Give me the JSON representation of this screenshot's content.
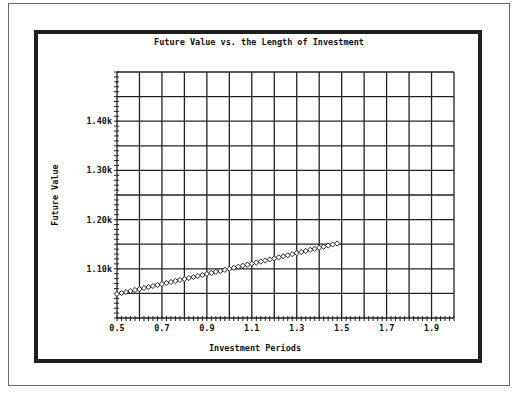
{
  "chart_data": {
    "type": "scatter",
    "title": "Future Value vs. the Length of Investment",
    "xlabel": "Investment Periods",
    "ylabel": "Future Value",
    "xlim": [
      0.5,
      2.0
    ],
    "ylim": [
      1000,
      1500
    ],
    "xticks": [
      0.5,
      0.7,
      0.9,
      1.1,
      1.3,
      1.5,
      1.7,
      1.9
    ],
    "xtick_labels": [
      "0.5",
      "0.7",
      "0.9",
      "1.1",
      "1.3",
      "1.5",
      "1.7",
      "1.9"
    ],
    "yticks": [
      1100,
      1200,
      1300,
      1400
    ],
    "ytick_labels": [
      "1.10k",
      "1.20k",
      "1.30k",
      "1.40k"
    ],
    "x_gridlines_step": 0.1,
    "y_gridlines_step": 50,
    "grid": true,
    "legend": null,
    "marker": "open-diamond",
    "series": [
      {
        "name": "Future Value",
        "x": [
          0.5,
          0.52,
          0.54,
          0.56,
          0.58,
          0.6,
          0.62,
          0.64,
          0.66,
          0.68,
          0.7,
          0.72,
          0.74,
          0.76,
          0.78,
          0.8,
          0.82,
          0.84,
          0.86,
          0.88,
          0.9,
          0.92,
          0.94,
          0.96,
          0.98,
          1.0,
          1.02,
          1.04,
          1.06,
          1.08,
          1.1,
          1.12,
          1.14,
          1.16,
          1.18,
          1.2,
          1.22,
          1.24,
          1.26,
          1.28,
          1.3,
          1.32,
          1.34,
          1.36,
          1.38,
          1.4,
          1.42,
          1.44,
          1.46,
          1.48
        ],
        "y": [
          1048.8,
          1050.8,
          1052.8,
          1054.8,
          1056.8,
          1058.8,
          1060.9,
          1062.9,
          1064.9,
          1067.0,
          1069.0,
          1071.0,
          1073.1,
          1075.1,
          1077.2,
          1079.2,
          1081.3,
          1083.3,
          1085.4,
          1087.5,
          1089.5,
          1091.6,
          1093.7,
          1095.8,
          1097.9,
          1100.0,
          1102.1,
          1104.2,
          1106.3,
          1108.4,
          1110.5,
          1112.7,
          1114.8,
          1116.9,
          1119.1,
          1121.2,
          1123.3,
          1125.5,
          1127.6,
          1129.8,
          1132.0,
          1134.1,
          1136.3,
          1138.5,
          1140.6,
          1142.8,
          1145.0,
          1147.2,
          1149.4,
          1151.5
        ]
      }
    ]
  }
}
